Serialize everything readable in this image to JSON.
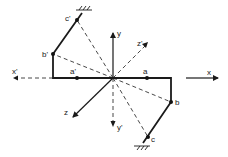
{
  "diagram": {
    "type": "coordinate-axes-with-frame",
    "colors": {
      "ink": "#1a1a1a",
      "background": "#ffffff"
    },
    "origin": {
      "x": 113,
      "y": 78
    },
    "axes": [
      {
        "id": "x",
        "label": "x",
        "style": "solid",
        "direction": "right"
      },
      {
        "id": "x_prime",
        "label": "x'",
        "style": "dashed",
        "direction": "left"
      },
      {
        "id": "y",
        "label": "y",
        "style": "solid",
        "direction": "up"
      },
      {
        "id": "y_prime",
        "label": "y'",
        "style": "dashed",
        "direction": "down"
      },
      {
        "id": "z",
        "label": "z",
        "style": "solid",
        "direction": "down-left"
      },
      {
        "id": "z_prime",
        "label": "z'",
        "style": "dashed",
        "direction": "up-right"
      }
    ],
    "points": [
      {
        "id": "a",
        "label": "a"
      },
      {
        "id": "b",
        "label": "b"
      },
      {
        "id": "c",
        "label": "c"
      },
      {
        "id": "a_prime",
        "label": "a'"
      },
      {
        "id": "b_prime",
        "label": "b'"
      },
      {
        "id": "c_prime",
        "label": "c'"
      }
    ],
    "supports": [
      {
        "id": "support-top",
        "at": "c'",
        "symbol": "fixed-hatch"
      },
      {
        "id": "support-bottom",
        "at": "c",
        "symbol": "fixed-hatch"
      }
    ]
  }
}
